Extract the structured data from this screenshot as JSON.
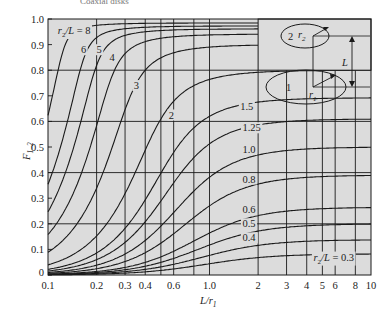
{
  "clipped_caption": "Coaxial disks",
  "chart_data": {
    "type": "line",
    "title": "",
    "xlabel": "L/r1",
    "ylabel": "F1-2",
    "xscale": "log",
    "xlim": [
      0.1,
      10
    ],
    "ylim": [
      0,
      1.0
    ],
    "grid": true,
    "x_ticks": [
      {
        "v": 0.1,
        "t": "0.1"
      },
      {
        "v": 0.2,
        "t": "0.2"
      },
      {
        "v": 0.3,
        "t": "0.3"
      },
      {
        "v": 0.4,
        "t": "0.4"
      },
      {
        "v": 0.6,
        "t": "0.6"
      },
      {
        "v": 1.0,
        "t": "1.0"
      },
      {
        "v": 2,
        "t": "2"
      },
      {
        "v": 3,
        "t": "3"
      },
      {
        "v": 4,
        "t": "4"
      },
      {
        "v": 5,
        "t": "5"
      },
      {
        "v": 6,
        "t": "6"
      },
      {
        "v": 8,
        "t": "8"
      },
      {
        "v": 10,
        "t": "10"
      }
    ],
    "x_gridlines": [
      0.2,
      0.3,
      0.4,
      0.5,
      0.6,
      0.8,
      1.0,
      2,
      3,
      4,
      5,
      6,
      8
    ],
    "y_ticks": [
      {
        "v": 0,
        "t": "0"
      },
      {
        "v": 0.1,
        "t": "0.1"
      },
      {
        "v": 0.2,
        "t": "0.2"
      },
      {
        "v": 0.3,
        "t": "0.3"
      },
      {
        "v": 0.4,
        "t": "0.4"
      },
      {
        "v": 0.5,
        "t": "0.5"
      },
      {
        "v": 0.6,
        "t": "0.6"
      },
      {
        "v": 0.7,
        "t": "0.7"
      },
      {
        "v": 0.8,
        "t": "0.8"
      },
      {
        "v": 0.9,
        "t": "0.9"
      },
      {
        "v": 1.0,
        "t": "1.0"
      }
    ],
    "y_gridlines": [
      0.2,
      0.4,
      0.6,
      0.8
    ],
    "parameter_name": "r2/L",
    "series": [
      {
        "name": "r2/L = 8",
        "r2_over_L": 8,
        "label": "r2/L = 8",
        "label_at": [
          0.115,
          0.955
        ]
      },
      {
        "name": "6",
        "r2_over_L": 6,
        "label": "6",
        "label_at": [
          0.16,
          0.88
        ]
      },
      {
        "name": "5",
        "r2_over_L": 5,
        "label": "5",
        "label_at": [
          0.2,
          0.88
        ]
      },
      {
        "name": "4",
        "r2_over_L": 4,
        "label": "4",
        "label_at": [
          0.24,
          0.85
        ]
      },
      {
        "name": "3",
        "r2_over_L": 3,
        "label": "3",
        "label_at": [
          0.34,
          0.74
        ]
      },
      {
        "name": "2",
        "r2_over_L": 2,
        "label": "2",
        "label_at": [
          0.56,
          0.625
        ]
      },
      {
        "name": "1.5",
        "r2_over_L": 1.5,
        "label": "1.5",
        "label_at": [
          1.55,
          0.66
        ]
      },
      {
        "name": "1.25",
        "r2_over_L": 1.25,
        "label": "1.25",
        "label_at": [
          1.6,
          0.575
        ]
      },
      {
        "name": "1.0",
        "r2_over_L": 1.0,
        "label": "1.0",
        "label_at": [
          1.6,
          0.49
        ]
      },
      {
        "name": "0.8",
        "r2_over_L": 0.8,
        "label": "0.8",
        "label_at": [
          1.6,
          0.375
        ]
      },
      {
        "name": "0.6",
        "r2_over_L": 0.6,
        "label": "0.6",
        "label_at": [
          1.6,
          0.255
        ]
      },
      {
        "name": "0.5",
        "r2_over_L": 0.5,
        "label": "0.5",
        "label_at": [
          1.6,
          0.2
        ]
      },
      {
        "name": "0.4",
        "r2_over_L": 0.4,
        "label": "0.4",
        "label_at": [
          1.6,
          0.145
        ]
      },
      {
        "name": "r2/L = 0.3",
        "r2_over_L": 0.3,
        "label": "r2/L = 0.3",
        "label_at": [
          4.4,
          0.07
        ]
      }
    ],
    "inset": {
      "disk1_label": "1",
      "disk2_label": "2",
      "r1_label": "r1",
      "r2_label": "r2",
      "L_label": "L"
    }
  }
}
